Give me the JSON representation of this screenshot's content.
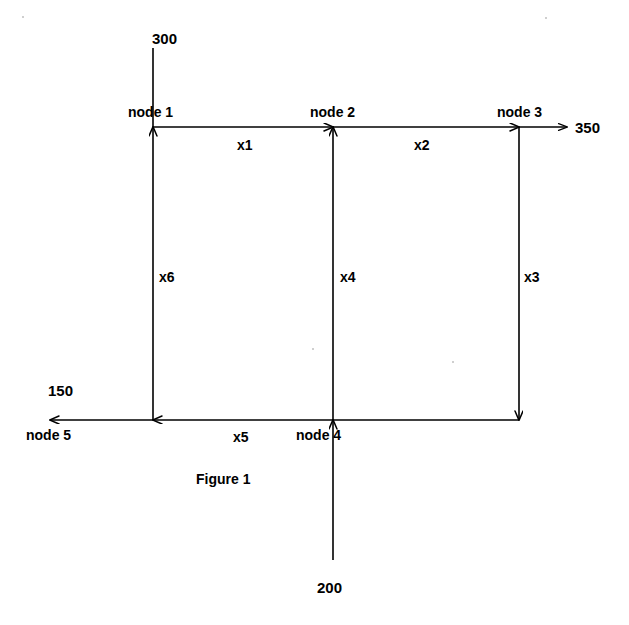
{
  "figure": {
    "caption": "Figure 1",
    "caption_pos": {
      "x": 196,
      "y": 472
    }
  },
  "nodes": [
    {
      "id": "node1",
      "label": "node 1",
      "cx": 153,
      "cy": 127,
      "label_pos": {
        "x": 128,
        "y": 105
      }
    },
    {
      "id": "node2",
      "label": "node 2",
      "cx": 333,
      "cy": 127,
      "label_pos": {
        "x": 310,
        "y": 105
      }
    },
    {
      "id": "node3",
      "label": "node 3",
      "cx": 519,
      "cy": 127,
      "label_pos": {
        "x": 497,
        "y": 105
      }
    },
    {
      "id": "node4",
      "label": "node 4",
      "cx": 333,
      "cy": 420,
      "label_pos": {
        "x": 296,
        "y": 428
      }
    },
    {
      "id": "node5",
      "label": "node 5",
      "cx": 50,
      "cy": 420,
      "label_pos": {
        "x": 26,
        "y": 428
      }
    }
  ],
  "edges": [
    {
      "id": "x1",
      "label": "x1",
      "from": "node1",
      "to": "node2",
      "label_pos": {
        "x": 237,
        "y": 138
      }
    },
    {
      "id": "x2",
      "label": "x2",
      "from": "node2",
      "to": "node3",
      "label_pos": {
        "x": 414,
        "y": 138
      }
    },
    {
      "id": "x3",
      "label": "x3",
      "from": "node3",
      "to": "corner-bottom-right",
      "label_pos": {
        "x": 524,
        "y": 270
      }
    },
    {
      "id": "x4",
      "label": "x4",
      "from": "node4",
      "to": "node2",
      "label_pos": {
        "x": 340,
        "y": 270
      }
    },
    {
      "id": "x5",
      "label": "x5",
      "from": "node4",
      "to": "corner-bottom-left",
      "label_pos": {
        "x": 233,
        "y": 430
      }
    },
    {
      "id": "x6",
      "label": "x6",
      "from": "corner-bottom-left",
      "to": "node1",
      "label_pos": {
        "x": 159,
        "y": 270
      }
    }
  ],
  "external_flows": [
    {
      "id": "supply-300",
      "label": "300",
      "direction": "inflow",
      "at_node": "node1",
      "label_pos": {
        "x": 152,
        "y": 31
      }
    },
    {
      "id": "demand-350",
      "label": "350",
      "direction": "outflow",
      "at_node": "node3",
      "label_pos": {
        "x": 575,
        "y": 120
      }
    },
    {
      "id": "demand-150",
      "label": "150",
      "direction": "outflow",
      "at_node": "node5",
      "label_pos": {
        "x": 48,
        "y": 383
      }
    },
    {
      "id": "supply-200",
      "label": "200",
      "direction": "inflow",
      "at_node": "node4",
      "label_pos": {
        "x": 317,
        "y": 580
      }
    }
  ],
  "colors": {
    "ink": "#000000",
    "background": "#ffffff",
    "speck": "#cfcfcf"
  }
}
